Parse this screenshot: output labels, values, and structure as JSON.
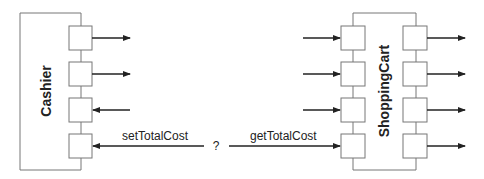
{
  "components": {
    "cashier": {
      "label": "Cashier",
      "ports": [
        {
          "direction": "out"
        },
        {
          "direction": "out"
        },
        {
          "direction": "in"
        },
        {
          "direction": "in",
          "label": "setTotalCost"
        }
      ]
    },
    "shopping_cart": {
      "label": "ShoppingCart",
      "left_ports": [
        {
          "direction": "in"
        },
        {
          "direction": "in"
        },
        {
          "direction": "in"
        },
        {
          "direction": "in",
          "label": "getTotalCost"
        }
      ],
      "right_ports": [
        {
          "direction": "out"
        },
        {
          "direction": "out"
        },
        {
          "direction": "out"
        },
        {
          "direction": "out"
        }
      ]
    }
  },
  "connector": {
    "left_label": "setTotalCost",
    "middle_label": "?",
    "right_label": "getTotalCost"
  },
  "colors": {
    "line": "#555555",
    "arrow": "#222222"
  }
}
